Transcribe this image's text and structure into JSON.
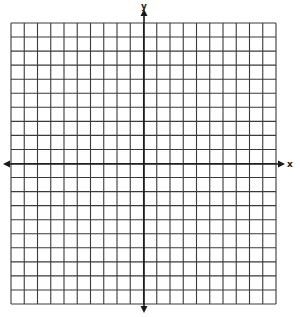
{
  "chart_data": {
    "type": "coordinate-grid",
    "title": "",
    "xlabel": "x",
    "ylabel": "y",
    "grid": true,
    "columns": 20,
    "rows": 20,
    "xlim": [
      -10,
      10
    ],
    "ylim": [
      -10,
      10
    ],
    "tick_labels": [],
    "x_axis_arrows": "both",
    "y_axis_arrows": "both"
  },
  "axes": {
    "x_label": "x",
    "y_label": "y"
  },
  "colors": {
    "grid_line": "#3a3a3a",
    "axis_line": "#1a1a1a",
    "background": "#ffffff"
  }
}
